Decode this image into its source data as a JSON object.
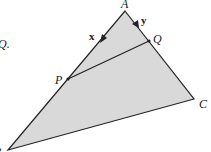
{
  "diagram": {
    "partial_text": "Q.",
    "fill_color": "#d9d9d9",
    "line_color": "#222222",
    "points": {
      "A": {
        "label": "A",
        "x": 125,
        "y": 11
      },
      "Q": {
        "label": "Q",
        "x": 149,
        "y": 41
      },
      "P": {
        "label": "P",
        "x": 68,
        "y": 79
      },
      "C": {
        "label": "C",
        "x": 194,
        "y": 99
      },
      "B": {
        "label": "B",
        "x": 8,
        "y": 150
      }
    },
    "vectors": {
      "x": {
        "label": "x",
        "from": "A",
        "toward": "P"
      },
      "y": {
        "label": "y",
        "from": "A",
        "toward": "Q"
      }
    },
    "segments": [
      "A-B",
      "A-C",
      "B-C",
      "P-Q"
    ]
  }
}
